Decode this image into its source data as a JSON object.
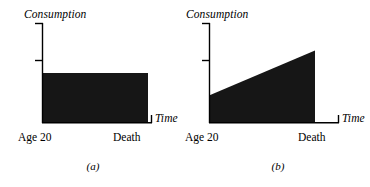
{
  "figure": {
    "ink_color": "#161616",
    "axis_color": "#000000",
    "background": "#ffffff",
    "panels": [
      {
        "id": "a",
        "subcaption": "(a)",
        "y_axis_label": "Consumption",
        "x_axis_label": "Time",
        "x_start_label": "Age 20",
        "x_end_label": "Death",
        "chart_data": {
          "type": "area",
          "title": "",
          "xlabel": "Time",
          "ylabel": "Consumption",
          "categories": [
            "Age 20",
            "Death"
          ],
          "x": [
            0,
            1
          ],
          "series": [
            {
              "name": "Consumption path",
              "values": [
                1.0,
                1.0
              ]
            }
          ],
          "xlim": [
            0,
            1
          ],
          "ylim": [
            0,
            2.0
          ],
          "grid": false,
          "legend": "none",
          "yticks": [
            1.0,
            2.0
          ],
          "ytick_labels": [
            "",
            ""
          ],
          "annotation": "Flat (constant) consumption from Age 20 until Death"
        }
      },
      {
        "id": "b",
        "subcaption": "(b)",
        "y_axis_label": "Consumption",
        "x_axis_label": "Time",
        "x_start_label": "Age 20",
        "x_end_label": "Death",
        "chart_data": {
          "type": "area",
          "title": "",
          "xlabel": "Time",
          "ylabel": "Consumption",
          "categories": [
            "Age 20",
            "Death"
          ],
          "x": [
            0,
            1
          ],
          "series": [
            {
              "name": "Consumption path",
              "values": [
                0.55,
                1.45
              ]
            }
          ],
          "xlim": [
            0,
            1
          ],
          "ylim": [
            0,
            2.0
          ],
          "grid": false,
          "legend": "none",
          "yticks": [
            1.0,
            2.0
          ],
          "ytick_labels": [
            "",
            ""
          ],
          "annotation": "Upward sloping (rising) consumption from Age 20 until Death"
        }
      }
    ]
  }
}
